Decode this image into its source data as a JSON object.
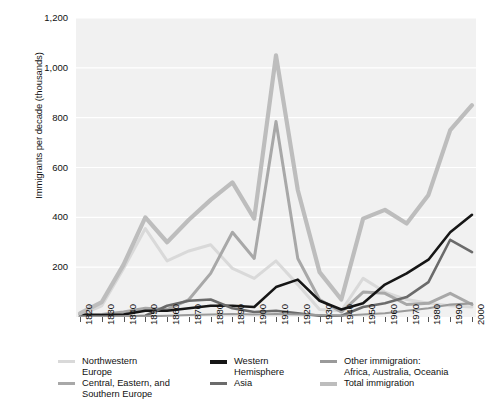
{
  "chart_data": {
    "type": "line",
    "title": "",
    "xlabel": "",
    "ylabel": "Immigrants per decade\n(thousands)",
    "xlim": [
      1820,
      2000
    ],
    "ylim": [
      0,
      1200
    ],
    "grid": true,
    "legend_position": "bottom",
    "x": [
      1820,
      1830,
      1840,
      1850,
      1860,
      1870,
      1880,
      1890,
      1900,
      1910,
      1920,
      1930,
      1940,
      1950,
      1960,
      1970,
      1980,
      1990,
      2000
    ],
    "xtick_labels": [
      "1820",
      "1830",
      "1840",
      "1850",
      "1860",
      "1870",
      "1880",
      "1890",
      "1900",
      "1910",
      "1920",
      "1930",
      "1940",
      "1950",
      "1960",
      "1970",
      "1980",
      "1990",
      "2000"
    ],
    "ytick_labels": [
      "200",
      "400",
      "600",
      "800",
      "1,000",
      "1,200"
    ],
    "ytick_values": [
      200,
      400,
      600,
      800,
      1000,
      1200
    ],
    "series": [
      {
        "name": "Northwestern Europe",
        "color": "#d9d9d9",
        "width": 3.0,
        "values": [
          8,
          45,
          195,
          355,
          225,
          265,
          290,
          195,
          155,
          225,
          130,
          30,
          25,
          155,
          100,
          70,
          55,
          45,
          40
        ]
      },
      {
        "name": "Central, Eastern, and Southern Europe",
        "color": "#a8a8a8",
        "width": 3.0,
        "values": [
          2,
          10,
          20,
          35,
          30,
          70,
          175,
          340,
          235,
          785,
          235,
          70,
          20,
          100,
          95,
          50,
          55,
          95,
          50
        ]
      },
      {
        "name": "Western Hemisphere",
        "color": "#161616",
        "width": 2.6,
        "values": [
          10,
          8,
          10,
          25,
          25,
          35,
          45,
          45,
          40,
          120,
          150,
          65,
          30,
          55,
          130,
          175,
          230,
          340,
          410
        ]
      },
      {
        "name": "Asia",
        "color": "#6b6b6b",
        "width": 2.6,
        "values": [
          0,
          0,
          0,
          5,
          45,
          65,
          70,
          35,
          20,
          25,
          15,
          5,
          5,
          40,
          55,
          80,
          140,
          310,
          260
        ]
      },
      {
        "name": "Other immigration: Africa, Australia, Oceania",
        "color": "#9a9a9a",
        "width": 2.2,
        "values": [
          2,
          2,
          3,
          3,
          5,
          8,
          10,
          12,
          10,
          12,
          10,
          8,
          5,
          10,
          15,
          25,
          35,
          50,
          55
        ]
      },
      {
        "name": "Total immigration",
        "color": "#bdbdbd",
        "width": 4.2,
        "values": [
          15,
          60,
          210,
          400,
          300,
          390,
          470,
          540,
          395,
          1050,
          510,
          180,
          70,
          395,
          430,
          375,
          490,
          750,
          850
        ]
      }
    ],
    "legend": [
      {
        "label": "Northwestern\nEurope",
        "color": "#d9d9d9",
        "thick": false
      },
      {
        "label": "Western\nHemisphere",
        "color": "#161616",
        "thick": true
      },
      {
        "label": "Other immigration:\nAfrica, Australia, Oceania",
        "color": "#9a9a9a",
        "thick": false
      },
      {
        "label": "Central, Eastern, and\nSouthern Europe",
        "color": "#a8a8a8",
        "thick": false
      },
      {
        "label": "Asia",
        "color": "#6b6b6b",
        "thick": false
      },
      {
        "label": "Total immigration",
        "color": "#bdbdbd",
        "thick": true
      }
    ]
  }
}
